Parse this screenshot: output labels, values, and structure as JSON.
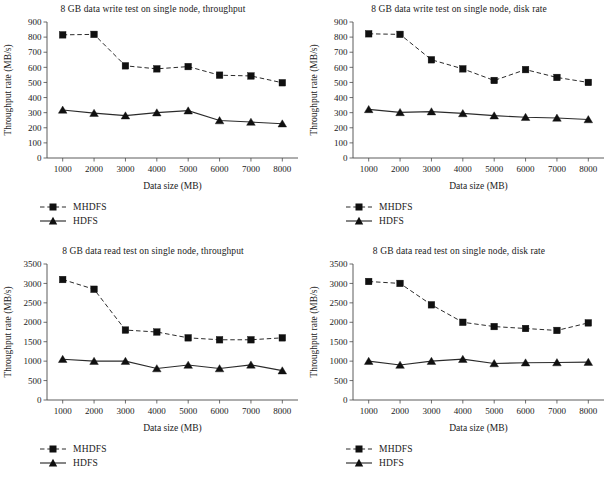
{
  "figure": {
    "panel_count": 4,
    "xlabel": "Data size (MB)",
    "ylabel": "Throughput rate (MB/s)",
    "legend": {
      "mhdfs_label": "MHDFS",
      "hdfs_label": "HDFS",
      "mhdfs_marker": "square-marker",
      "hdfs_marker": "triangle-marker",
      "mhdfs_linestyle": "dashed",
      "hdfs_linestyle": "solid"
    },
    "colors": {
      "line": "#2b2b2b",
      "marker": "#101010",
      "axis": "#4a4a4a",
      "text": "#1a1a1a",
      "background": "#ffffff"
    }
  },
  "chart_data": [
    {
      "id": "write-throughput",
      "type": "line",
      "title": "8 GB data write test on single node, throughput",
      "xlabel": "Data size (MB)",
      "ylabel": "Throughput rate (MB/s)",
      "x": [
        1000,
        2000,
        3000,
        4000,
        5000,
        6000,
        7000,
        8000
      ],
      "categories": [
        "1000",
        "2000",
        "3000",
        "4000",
        "5000",
        "6000",
        "7000",
        "8000"
      ],
      "xlim": [
        500,
        8500
      ],
      "ylim": [
        0,
        900
      ],
      "yticks": [
        0,
        100,
        200,
        300,
        400,
        500,
        600,
        700,
        800,
        900
      ],
      "grid": false,
      "legend_position": "below-left",
      "series": [
        {
          "name": "MHDFS",
          "linestyle": "dashed",
          "marker": "square",
          "values": [
            815,
            818,
            610,
            590,
            605,
            548,
            543,
            498
          ]
        },
        {
          "name": "HDFS",
          "linestyle": "solid",
          "marker": "triangle",
          "values": [
            318,
            297,
            280,
            300,
            313,
            248,
            238,
            227
          ]
        }
      ]
    },
    {
      "id": "write-disk-rate",
      "type": "line",
      "title": "8 GB data write test on single node, disk rate",
      "xlabel": "Data size (MB)",
      "ylabel": "Throughput rate (MB/s)",
      "x": [
        1000,
        2000,
        3000,
        4000,
        5000,
        6000,
        7000,
        8000
      ],
      "categories": [
        "1000",
        "2000",
        "3000",
        "4000",
        "5000",
        "6000",
        "7000",
        "8000"
      ],
      "xlim": [
        500,
        8500
      ],
      "ylim": [
        0,
        900
      ],
      "yticks": [
        0,
        100,
        200,
        300,
        400,
        500,
        600,
        700,
        800,
        900
      ],
      "grid": false,
      "legend_position": "below-left",
      "series": [
        {
          "name": "MHDFS",
          "linestyle": "dashed",
          "marker": "square",
          "values": [
            822,
            818,
            650,
            590,
            513,
            585,
            533,
            500
          ]
        },
        {
          "name": "HDFS",
          "linestyle": "solid",
          "marker": "triangle",
          "values": [
            322,
            302,
            307,
            295,
            280,
            270,
            265,
            255
          ]
        }
      ]
    },
    {
      "id": "read-throughput",
      "type": "line",
      "title": "8 GB data read test on single node, throughput",
      "xlabel": "Data size (MB)",
      "ylabel": "Throughput rate (MB/s)",
      "x": [
        1000,
        2000,
        3000,
        4000,
        5000,
        6000,
        7000,
        8000
      ],
      "categories": [
        "1000",
        "2000",
        "3000",
        "4000",
        "5000",
        "6000",
        "7000",
        "8000"
      ],
      "xlim": [
        500,
        8500
      ],
      "ylim": [
        0,
        3500
      ],
      "yticks": [
        0,
        500,
        1000,
        1500,
        2000,
        2500,
        3000,
        3500
      ],
      "grid": false,
      "legend_position": "below-left",
      "series": [
        {
          "name": "MHDFS",
          "linestyle": "dashed",
          "marker": "square",
          "values": [
            3100,
            2850,
            1800,
            1750,
            1600,
            1550,
            1550,
            1600
          ]
        },
        {
          "name": "HDFS",
          "linestyle": "solid",
          "marker": "triangle",
          "values": [
            1050,
            1000,
            1000,
            810,
            900,
            810,
            905,
            755
          ]
        }
      ]
    },
    {
      "id": "read-disk-rate",
      "type": "line",
      "title": "8 GB data read test on single node, disk rate",
      "xlabel": "Data size (MB)",
      "ylabel": "Throughput rate (MB/s)",
      "x": [
        1000,
        2000,
        3000,
        4000,
        5000,
        6000,
        7000,
        8000
      ],
      "categories": [
        "1000",
        "2000",
        "3000",
        "4000",
        "5000",
        "6000",
        "7000",
        "8000"
      ],
      "xlim": [
        500,
        8500
      ],
      "ylim": [
        0,
        3500
      ],
      "yticks": [
        0,
        500,
        1000,
        1500,
        2000,
        2500,
        3000,
        3500
      ],
      "grid": false,
      "legend_position": "below-left",
      "series": [
        {
          "name": "MHDFS",
          "linestyle": "dashed",
          "marker": "square",
          "values": [
            3050,
            3000,
            2450,
            2000,
            1890,
            1840,
            1790,
            1985
          ]
        },
        {
          "name": "HDFS",
          "linestyle": "solid",
          "marker": "triangle",
          "values": [
            1000,
            900,
            1000,
            1050,
            940,
            960,
            965,
            975
          ]
        }
      ]
    }
  ]
}
